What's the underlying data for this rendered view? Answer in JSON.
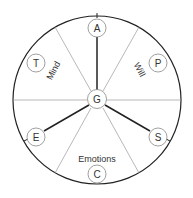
{
  "diagram": {
    "center_node": {
      "id": "G",
      "label": "G"
    },
    "nodes": [
      {
        "id": "A",
        "label": "A"
      },
      {
        "id": "P",
        "label": "P"
      },
      {
        "id": "S",
        "label": "S"
      },
      {
        "id": "C",
        "label": "C"
      },
      {
        "id": "E",
        "label": "E"
      },
      {
        "id": "T",
        "label": "T"
      }
    ],
    "sector_labels": [
      {
        "id": "mind",
        "label": "Mind"
      },
      {
        "id": "will",
        "label": "Will"
      },
      {
        "id": "emotions",
        "label": "Emotions"
      }
    ],
    "connections": [
      {
        "from": "G",
        "to": "A"
      },
      {
        "from": "G",
        "to": "S"
      },
      {
        "from": "G",
        "to": "E"
      }
    ],
    "colors": {
      "stroke": "#222222",
      "divider": "#999999",
      "node_stroke": "#888888",
      "text": "#333333"
    }
  }
}
